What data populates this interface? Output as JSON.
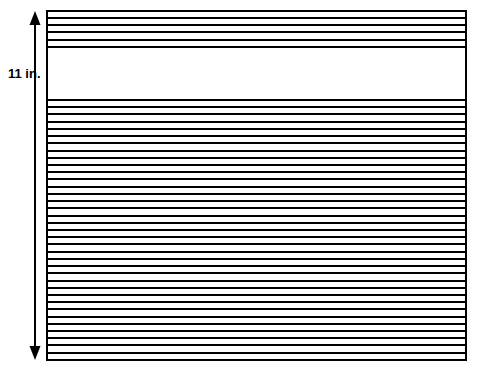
{
  "figure": {
    "dimension_label": "11 in.",
    "paper": {
      "left": 47,
      "right": 466,
      "top": 11,
      "bottom": 360,
      "border_color": "#000000",
      "border_width": 2,
      "fill_color": "#ffffff"
    },
    "rule_color": "#000000",
    "rule_width": 2,
    "top_band": {
      "description": "header rules at top of sheet",
      "count": 6,
      "y_positions": [
        11,
        18,
        25,
        32,
        40,
        47
      ]
    },
    "gap": {
      "description": "blank unruled band",
      "top": 47,
      "bottom": 100
    },
    "bottom_band": {
      "description": "main body rules",
      "count": 37,
      "start_y": 100,
      "spacing": 7.22,
      "end_y": 360
    },
    "dimension_arrow": {
      "x": 35,
      "top": 11,
      "bottom": 360,
      "color": "#000000",
      "line_width": 2,
      "head_width": 11,
      "head_height": 14,
      "double_headed": true
    },
    "label_position": {
      "x": 8,
      "y": 67
    }
  },
  "chart_data": {
    "type": "diagram",
    "annotations": [
      "11 in."
    ],
    "elements": [
      {
        "name": "paper-rectangle",
        "shape": "rectangle",
        "x": 47,
        "y": 11,
        "width": 419,
        "height": 349
      },
      {
        "name": "top-rule-band",
        "shape": "horizontal-lines",
        "count": 6,
        "from_y": 11,
        "to_y": 47
      },
      {
        "name": "blank-band",
        "shape": "empty",
        "from_y": 47,
        "to_y": 100
      },
      {
        "name": "bottom-rule-band",
        "shape": "horizontal-lines",
        "count": 37,
        "from_y": 100,
        "to_y": 360
      },
      {
        "name": "height-dimension",
        "shape": "double-arrow",
        "x": 35,
        "from_y": 11,
        "to_y": 360,
        "label": "11 in."
      }
    ]
  }
}
